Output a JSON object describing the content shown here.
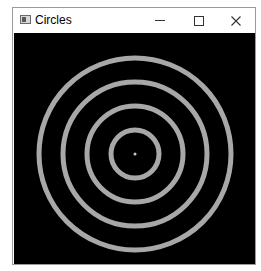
{
  "window": {
    "title": "Circles",
    "controls": {
      "minimize": "minimize",
      "maximize": "maximize",
      "close": "close"
    }
  },
  "canvas": {
    "background": "#000000",
    "ring_color": "#a8a8a8",
    "center_dot_color": "#c8c8c8",
    "center": [
      121,
      121
    ],
    "radii": [
      24,
      48,
      72,
      96
    ],
    "stroke_width": 5,
    "center_dot_radius": 1.5
  }
}
